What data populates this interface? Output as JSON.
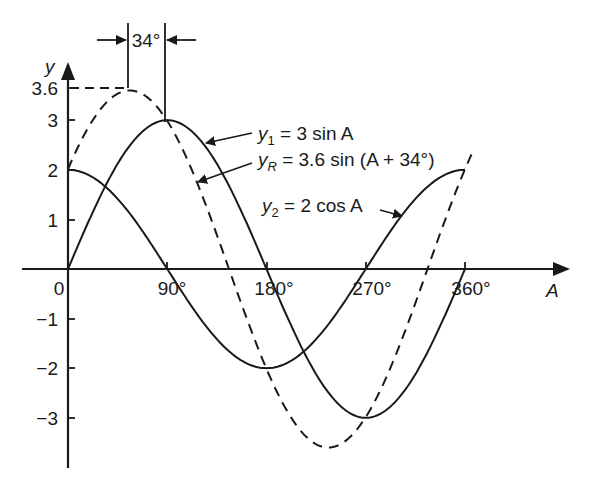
{
  "chart_data": {
    "type": "line",
    "title": "",
    "xlabel": "A",
    "ylabel": "y",
    "x_unit": "degrees",
    "xlim": [
      0,
      360
    ],
    "ylim": [
      -3.6,
      3.6
    ],
    "grid": false,
    "x_ticks": [
      {
        "value": 0,
        "label": "0"
      },
      {
        "value": 90,
        "label": "90°"
      },
      {
        "value": 180,
        "label": "180°"
      },
      {
        "value": 270,
        "label": "270°"
      },
      {
        "value": 360,
        "label": "360°"
      }
    ],
    "y_ticks": [
      {
        "value": 3.6,
        "label": "3.6"
      },
      {
        "value": 3,
        "label": "3"
      },
      {
        "value": 2,
        "label": "2"
      },
      {
        "value": 1,
        "label": "1"
      },
      {
        "value": -1,
        "label": "−1"
      },
      {
        "value": -2,
        "label": "−2"
      },
      {
        "value": -3,
        "label": "−3"
      }
    ],
    "series": [
      {
        "name": "y1",
        "label_main": "y",
        "label_sub": "1",
        "label_rest": " = 3 sin A",
        "formula": "3 sin A",
        "amplitude": 3,
        "phase_deg": 0,
        "fn": "sin",
        "style": "solid",
        "x": [
          0,
          30,
          60,
          90,
          120,
          150,
          180,
          210,
          240,
          270,
          300,
          330,
          360
        ],
        "values": [
          0,
          1.5,
          2.6,
          3,
          2.6,
          1.5,
          0,
          -1.5,
          -2.6,
          -3,
          -2.6,
          -1.5,
          0
        ]
      },
      {
        "name": "y2",
        "label_main": "y",
        "label_sub": "2",
        "label_rest": " = 2 cos A",
        "formula": "2 cos A",
        "amplitude": 2,
        "phase_deg": 90,
        "fn": "sin",
        "style": "solid",
        "x": [
          0,
          30,
          60,
          90,
          120,
          150,
          180,
          210,
          240,
          270,
          300,
          330,
          360
        ],
        "values": [
          2,
          1.73,
          1,
          0,
          -1,
          -1.73,
          -2,
          -1.73,
          -1,
          0,
          1,
          1.73,
          2
        ]
      },
      {
        "name": "yR",
        "label_main": "y",
        "label_sub": "R",
        "label_rest": " = 3.6 sin (A + 34°)",
        "formula": "3.6 sin (A + 34°)",
        "amplitude": 3.6,
        "phase_deg": 34,
        "fn": "sin",
        "style": "dashed",
        "x": [
          0,
          30,
          56,
          90,
          120,
          146,
          180,
          210,
          236,
          270,
          300,
          326,
          360
        ],
        "values": [
          2.01,
          3.24,
          3.6,
          2.98,
          1.8,
          0,
          -2.01,
          -3.24,
          -3.6,
          -2.98,
          -1.8,
          0,
          2.01
        ]
      }
    ],
    "annotations": [
      {
        "text": "34°",
        "type": "phase-difference",
        "between_deg": [
          56,
          90
        ]
      }
    ]
  }
}
